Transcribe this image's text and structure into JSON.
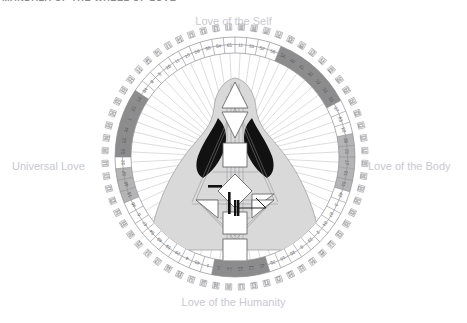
{
  "page": {
    "title": "MANDALA OF THE WHEEL OF LOVE",
    "background_color": "#ffffff"
  },
  "labels": {
    "top": "Love of the Self",
    "right": "Love of the Body",
    "bottom": "Love of the Humanity",
    "left": "Universal Love",
    "color": "#c9c9cf"
  },
  "colors": {
    "ring_line": "#8f8f95",
    "number_text": "#4a4a4a",
    "hexagram_glyph": "#6e6e74",
    "spoke_line": "#a9a9af",
    "highlight_band_dark": "#8c8c8c",
    "highlight_band_mid": "#b4b4b4",
    "body_fill": "#d9d9d9",
    "body_stroke": "#9a9a9a",
    "wing_black": "#111111",
    "center_white": "#ffffff",
    "center_gray": "#c2c2c2"
  },
  "mandala": {
    "type": "human-design-rave-mandala",
    "rings": [
      {
        "name": "outer-hexagram-ring",
        "count": 64,
        "description": "I-Ching hexagram glyph squares"
      },
      {
        "name": "gate-number-ring",
        "count": 64,
        "description": "numbered gate segments"
      },
      {
        "name": "spoke-ring",
        "count": 64,
        "description": "radial spoke lines to center"
      }
    ],
    "gate_numbers": [
      11,
      10,
      52,
      58,
      54,
      49,
      41,
      30,
      19,
      39,
      55,
      37,
      63,
      22,
      36,
      25,
      17,
      21,
      51,
      42,
      3,
      27,
      24,
      2,
      23,
      8,
      20,
      16,
      35,
      45,
      12,
      15,
      14,
      5,
      1,
      43,
      4,
      29,
      59,
      40,
      64,
      47,
      6,
      46,
      18,
      48,
      57,
      32,
      50,
      28,
      44,
      1,
      43,
      14,
      34,
      9,
      5,
      26,
      11,
      10,
      58,
      38,
      54,
      61
    ],
    "highlight_bands": [
      {
        "position": "top-right",
        "shade": "#8c8c8c"
      },
      {
        "position": "right",
        "shade": "#b4b4b4"
      },
      {
        "position": "left",
        "shade": "#8c8c8c"
      },
      {
        "position": "bottom-left",
        "shade": "#8c8c8c"
      },
      {
        "position": "bottom",
        "shade": "#b4b4b4"
      }
    ],
    "bodygraph": {
      "description": "central Human Design bodygraph silhouette",
      "centers": [
        {
          "name": "head",
          "shape": "triangle",
          "state": "undefined"
        },
        {
          "name": "ajna",
          "shape": "inverted-triangle",
          "state": "undefined"
        },
        {
          "name": "throat",
          "shape": "square",
          "state": "undefined"
        },
        {
          "name": "g-center",
          "shape": "diamond",
          "state": "undefined"
        },
        {
          "name": "heart",
          "shape": "triangle",
          "state": "undefined"
        },
        {
          "name": "spleen",
          "shape": "triangle",
          "state": "undefined"
        },
        {
          "name": "solar-plexus",
          "shape": "triangle",
          "state": "undefined"
        },
        {
          "name": "sacral",
          "shape": "square",
          "state": "undefined"
        },
        {
          "name": "root",
          "shape": "square",
          "state": "undefined"
        }
      ],
      "wings": {
        "count": 2,
        "color": "#111111"
      }
    }
  }
}
